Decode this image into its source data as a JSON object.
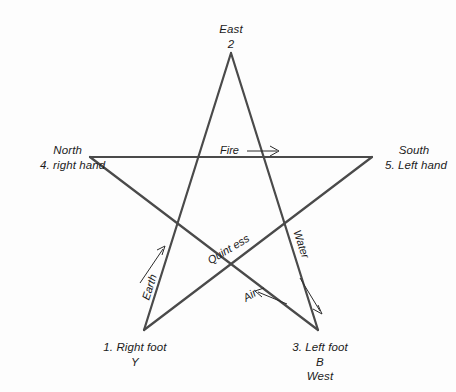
{
  "diagram": {
    "type": "pentagram",
    "background_color": "#fdfdfd",
    "line_color": "#4a4a4a",
    "text_color": "#1b1b1b",
    "points": {
      "top": {
        "direction": "East",
        "number": "2"
      },
      "left": {
        "direction": "North",
        "body_part": "4. right hand"
      },
      "right": {
        "direction": "South",
        "body_part": "5. Left hand"
      },
      "bottom_left": {
        "body_part": "1. Right foot",
        "letter": "Y"
      },
      "bottom_right": {
        "body_part": "3. Left foot",
        "letter": "B",
        "direction": "West"
      }
    },
    "elements": [
      {
        "name": "Fire",
        "arrow": "right"
      },
      {
        "name": "Quint ess",
        "arrow": "none"
      },
      {
        "name": "Water",
        "arrow": "down-right"
      },
      {
        "name": "Earth",
        "arrow": "up-right"
      },
      {
        "name": "Air",
        "arrow": "left"
      }
    ]
  }
}
